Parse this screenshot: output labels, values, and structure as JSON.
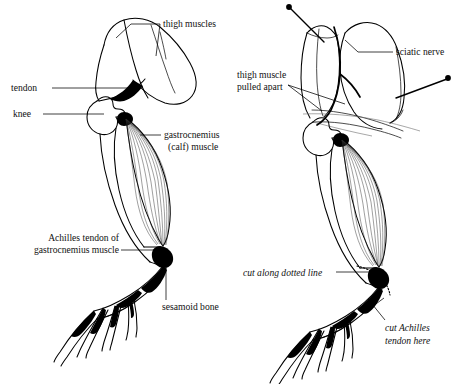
{
  "figure": {
    "background_color": "#ffffff",
    "ink_color": "#000000",
    "panels": [
      {
        "id": "left",
        "name": "intact-limb",
        "description": "Intact frog hind leg showing thigh, knee, gastrocnemius and foot"
      },
      {
        "id": "right",
        "name": "dissected-limb",
        "description": "Frog hind leg with thigh muscle pulled apart by pins exposing sciatic nerve, with cut marks"
      }
    ]
  },
  "labels": {
    "left": [
      {
        "id": "thigh-muscles",
        "text": "thigh muscles",
        "style": "roman",
        "x": 163,
        "y": 23,
        "anchor": "start"
      },
      {
        "id": "tendon",
        "text": "tendon",
        "style": "roman",
        "x": 11,
        "y": 91,
        "anchor": "start"
      },
      {
        "id": "knee",
        "text": "knee",
        "style": "roman",
        "x": 13,
        "y": 117,
        "anchor": "start"
      },
      {
        "id": "gastrocnemius",
        "text": "gastrocnemius",
        "style": "roman",
        "x": 163,
        "y": 138,
        "anchor": "start"
      },
      {
        "id": "calf-muscle",
        "text": "(calf) muscle",
        "style": "roman",
        "x": 166,
        "y": 150,
        "anchor": "start"
      },
      {
        "id": "achilles-tendon-of",
        "text": "Achilles tendon of",
        "style": "roman",
        "x": 104,
        "y": 240,
        "anchor": "end"
      },
      {
        "id": "gastrocnemius-muscle",
        "text": "gastrocnemius muscle",
        "style": "roman",
        "x": 118,
        "y": 252,
        "anchor": "end"
      },
      {
        "id": "sesamoid-bone",
        "text": "sesamoid bone",
        "style": "roman",
        "x": 161,
        "y": 310,
        "anchor": "start"
      }
    ],
    "right": [
      {
        "id": "sciatic-nerve",
        "text": "sciatic nerve",
        "style": "roman",
        "x": 395,
        "y": 51,
        "anchor": "start"
      },
      {
        "id": "thigh-muscle",
        "text": "thigh muscle",
        "style": "roman",
        "x": 237,
        "y": 78,
        "anchor": "start"
      },
      {
        "id": "pulled-apart",
        "text": "pulled apart",
        "style": "roman",
        "x": 237,
        "y": 90,
        "anchor": "start"
      },
      {
        "id": "cut-along-dotted-line",
        "text": "cut along dotted line",
        "style": "italic",
        "x": 243,
        "y": 276,
        "anchor": "start"
      },
      {
        "id": "cut-achilles",
        "text": "cut Achilles",
        "style": "italic",
        "x": 384,
        "y": 330,
        "anchor": "start"
      },
      {
        "id": "tendon-here",
        "text": "tendon here",
        "style": "italic",
        "x": 384,
        "y": 344,
        "anchor": "start"
      }
    ]
  }
}
